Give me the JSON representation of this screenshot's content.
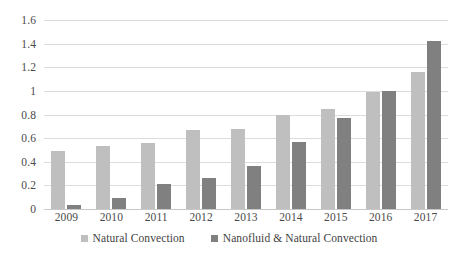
{
  "chart_data": {
    "type": "bar",
    "title": "",
    "subtitle": "",
    "xlabel": "",
    "ylabel": "",
    "categories": [
      "2009",
      "2010",
      "2011",
      "2012",
      "2013",
      "2014",
      "2015",
      "2016",
      "2017"
    ],
    "series": [
      {
        "name": "Natural Convection",
        "color": "#BFBFBF",
        "values": [
          0.49,
          0.53,
          0.56,
          0.67,
          0.68,
          0.8,
          0.85,
          0.99,
          1.16
        ]
      },
      {
        "name": "Nanofluid & Natural Convection",
        "color": "#808080",
        "values": [
          0.03,
          0.09,
          0.21,
          0.26,
          0.36,
          0.57,
          0.77,
          1.0,
          1.42
        ]
      }
    ],
    "ylim": [
      0,
      1.6
    ],
    "ytick_step": 0.2,
    "ytick_labels": [
      "0",
      "0.2",
      "0.4",
      "0.6",
      "0.8",
      "1",
      "1.2",
      "1.4",
      "1.6"
    ],
    "ytick_values": [
      0,
      0.2,
      0.4,
      0.6,
      0.8,
      1.0,
      1.2,
      1.4,
      1.6
    ],
    "grid": true,
    "grid_axis": "y",
    "legend_position": "bottom",
    "background_color": "#FFFFFF",
    "gridline_color": "#DCDCDC"
  }
}
